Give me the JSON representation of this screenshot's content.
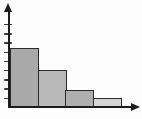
{
  "chart_data": {
    "type": "bar",
    "title": "",
    "subtitle": "",
    "xlabel": "",
    "ylabel": "",
    "categories": [
      "bar-1",
      "bar-2",
      "bar-3",
      "bar-4"
    ],
    "values": [
      6.5,
      4.1,
      1.9,
      1.0
    ],
    "ylim": [
      0,
      10.5
    ],
    "y_tick_count": 9,
    "y_tick_interval": 1,
    "x_tick_labels": [],
    "y_tick_labels": [],
    "grid": false,
    "legend": false,
    "axis_arrows": [
      "y-top",
      "x-right"
    ],
    "colors": {
      "axis": "#1c1c1c",
      "tick": "#3a3a3a",
      "bar_border": "#2b2b2b",
      "bar_fills": [
        "#a9a9a9",
        "#b9b9b9",
        "#aeaeae",
        "#d5d5d5"
      ],
      "background": "#fdfdfd"
    }
  }
}
